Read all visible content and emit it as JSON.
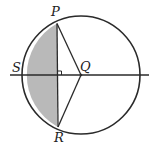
{
  "diagram": {
    "type": "circle-geometry",
    "labels": {
      "P": "P",
      "Q": "Q",
      "R": "R",
      "S": "S"
    },
    "colors": {
      "stroke": "#2a2a2a",
      "shade": "#b9b9b9",
      "background": "#ffffff"
    }
  }
}
